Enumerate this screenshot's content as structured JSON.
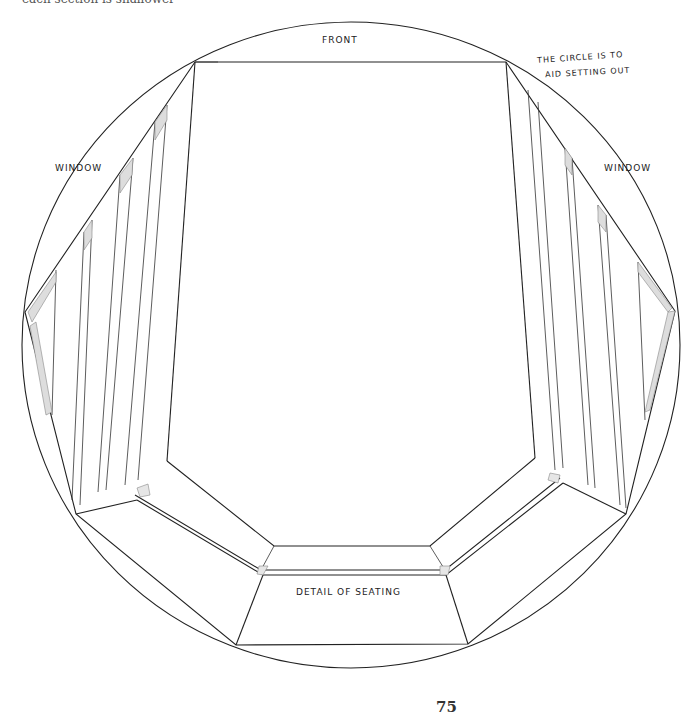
{
  "page": {
    "top_text_fragment": "each section is shallower",
    "page_number": "75"
  },
  "drawing": {
    "title": "Detail of seating",
    "labels": {
      "front": "FRONT",
      "window_left": "WINDOW",
      "window_right": "WINDOW",
      "seating": "DETAIL OF SEATING",
      "note_line1": "THE CIRCLE IS TO",
      "note_line2": "AID SETTING OUT"
    },
    "line_color": "#222222",
    "background": "#ffffff"
  }
}
